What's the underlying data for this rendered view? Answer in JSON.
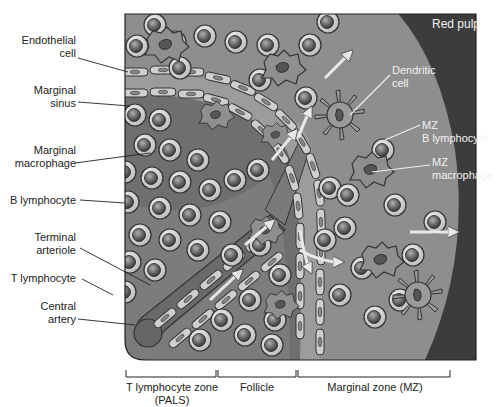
{
  "diagram": {
    "title_region": "Red pulp",
    "colors": {
      "red_pulp": "#3a3a3a",
      "marginal_zone": "#8c8c8c",
      "follicle": "#6e6e6e",
      "pals": "#7a7a7a",
      "sinus": "#9a9a9a",
      "cell_outer": "#d8d8d8",
      "cell_nucleus": "#6a6a6a",
      "macrophage": "#8a8a8a",
      "endothelial": "#c8c8c8",
      "arrow": "#e6e6e6"
    },
    "left_labels": [
      {
        "id": "endothelial-cell",
        "text": "Endothelial cell"
      },
      {
        "id": "marginal-sinus",
        "text": "Marginal sinus"
      },
      {
        "id": "marginal-macrophage",
        "text": "Marginal macrophage"
      },
      {
        "id": "b-lymphocyte",
        "text": "B lymphocyte"
      },
      {
        "id": "terminal-arteriole",
        "text": "Terminal arteriole"
      },
      {
        "id": "t-lymphocyte",
        "text": "T lymphocyte"
      },
      {
        "id": "central-artery",
        "text": "Central artery"
      }
    ],
    "right_labels": [
      {
        "id": "dendritic-cell",
        "text": "Dendritic cell"
      },
      {
        "id": "mz-b-lymphocyte",
        "text": "MZ B lymphocyte"
      },
      {
        "id": "mz-macrophage",
        "text": "MZ macrophage"
      }
    ],
    "zones": [
      {
        "id": "pals",
        "text": "T lymphocyte zone (PALS)"
      },
      {
        "id": "follicle",
        "text": "Follicle"
      },
      {
        "id": "marginal-zone",
        "text": "Marginal zone (MZ)"
      }
    ]
  },
  "labels": {
    "red_pulp": "Red pulp",
    "endothelial_1": "Endothelial",
    "endothelial_2": "cell",
    "sinus_1": "Marginal",
    "sinus_2": "sinus",
    "macro_1": "Marginal",
    "macro_2": "macrophage",
    "b_lymph": "B lymphocyte",
    "arteriole_1": "Terminal",
    "arteriole_2": "arteriole",
    "t_lymph": "T lymphocyte",
    "artery_1": "Central",
    "artery_2": "artery",
    "dendritic_1": "Dendritic",
    "dendritic_2": "cell",
    "mzb_1": "MZ",
    "mzb_2": "B lymphocyte",
    "mzm_1": "MZ",
    "mzm_2": "macrophage",
    "zone_pals_1": "T lymphocyte zone",
    "zone_pals_2": "(PALS)",
    "zone_follicle": "Follicle",
    "zone_mz": "Marginal zone (MZ)"
  }
}
